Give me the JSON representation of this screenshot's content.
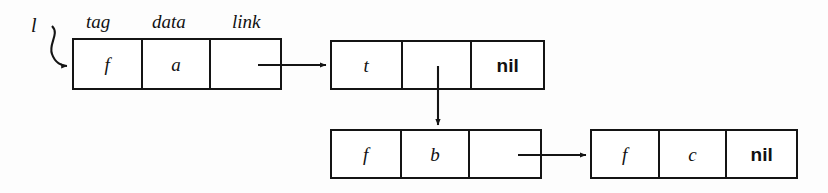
{
  "diagram": {
    "background_color": "#fdfdfd",
    "stroke_color": "#141414",
    "field_labels": {
      "tag": "tag",
      "data": "data",
      "link": "link"
    },
    "pointer_variable": "l",
    "nodes": [
      {
        "id": "node-1",
        "cells": [
          {
            "field": "tag",
            "value": "f",
            "style": "italic"
          },
          {
            "field": "data",
            "value": "a",
            "style": "italic"
          },
          {
            "field": "link",
            "value": "",
            "style": "italic"
          }
        ]
      },
      {
        "id": "node-2",
        "cells": [
          {
            "field": "tag",
            "value": "t",
            "style": "italic"
          },
          {
            "field": "data",
            "value": "",
            "style": "italic"
          },
          {
            "field": "link",
            "value": "nil",
            "style": "bold"
          }
        ]
      },
      {
        "id": "node-3",
        "cells": [
          {
            "field": "tag",
            "value": "f",
            "style": "italic"
          },
          {
            "field": "data",
            "value": "b",
            "style": "italic"
          },
          {
            "field": "link",
            "value": "",
            "style": "italic"
          }
        ]
      },
      {
        "id": "node-4",
        "cells": [
          {
            "field": "tag",
            "value": "f",
            "style": "italic"
          },
          {
            "field": "data",
            "value": "c",
            "style": "italic"
          },
          {
            "field": "link",
            "value": "nil",
            "style": "bold"
          }
        ]
      }
    ],
    "edges": [
      {
        "id": "edge-l-to-node1",
        "from": "pointer-l",
        "to": "node-1",
        "kind": "curved"
      },
      {
        "id": "edge-node1-to-node2",
        "from": "node-1.link",
        "to": "node-2",
        "kind": "horizontal"
      },
      {
        "id": "edge-node2-to-node3",
        "from": "node-2.data",
        "to": "node-3",
        "kind": "vertical"
      },
      {
        "id": "edge-node3-to-node4",
        "from": "node-3.link",
        "to": "node-4",
        "kind": "horizontal"
      }
    ]
  }
}
